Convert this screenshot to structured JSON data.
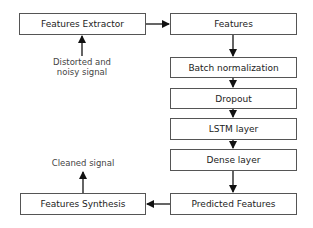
{
  "diagram": {
    "nodes": [
      {
        "id": "features-extractor",
        "label": "Features Extractor"
      },
      {
        "id": "features",
        "label": "Features"
      },
      {
        "id": "batch-normalization",
        "label": "Batch normalization"
      },
      {
        "id": "dropout",
        "label": "Dropout"
      },
      {
        "id": "lstm-layer",
        "label": "LSTM layer"
      },
      {
        "id": "dense-layer",
        "label": "Dense layer"
      },
      {
        "id": "predicted-features",
        "label": "Predicted Features"
      },
      {
        "id": "features-synthesis",
        "label": "Features Synthesis"
      }
    ],
    "annotations": {
      "input": {
        "line1": "Distorted and",
        "line2": "noisy signal"
      },
      "output": "Cleaned signal"
    },
    "edges": [
      {
        "from": "input",
        "to": "features-extractor"
      },
      {
        "from": "features-extractor",
        "to": "features"
      },
      {
        "from": "features",
        "to": "batch-normalization"
      },
      {
        "from": "batch-normalization",
        "to": "dropout"
      },
      {
        "from": "dropout",
        "to": "lstm-layer"
      },
      {
        "from": "lstm-layer",
        "to": "dense-layer"
      },
      {
        "from": "dense-layer",
        "to": "predicted-features"
      },
      {
        "from": "predicted-features",
        "to": "features-synthesis"
      },
      {
        "from": "features-synthesis",
        "to": "output"
      }
    ]
  }
}
